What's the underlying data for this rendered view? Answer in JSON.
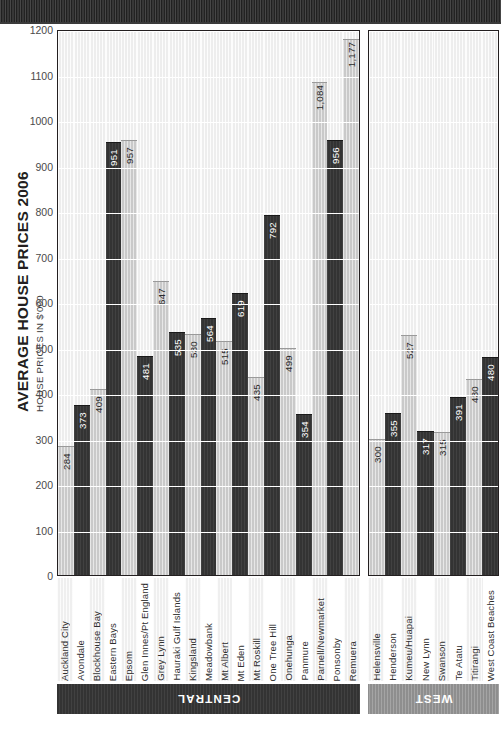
{
  "top_band": {
    "name": "decorative-band"
  },
  "chart_data": {
    "type": "bar",
    "title": "AVERAGE HOUSE PRICES 2006",
    "subtitle": "HOUSE PRICES IN $'000",
    "xlabel": "",
    "ylabel": "HOUSE PRICES IN $'000",
    "ylim": [
      0,
      1200
    ],
    "ytick_step": 100,
    "yticks": [
      1200,
      1100,
      1000,
      900,
      800,
      700,
      600,
      500,
      400,
      300,
      200,
      100,
      0
    ],
    "ytick_labels": [
      "1200",
      "1100",
      "1000",
      "900",
      "800",
      "700",
      "600",
      "500",
      "400",
      "300",
      "200",
      "100",
      "0"
    ],
    "grid": true,
    "legend": "none",
    "orientation": "vertical-bars-rotated-page",
    "groups": [
      {
        "name": "CENTRAL",
        "categories": [
          "Auckland City",
          "Avondale",
          "Blockhouse Bay",
          "Eastern Bays",
          "Epsom",
          "Glen Innes/Pt England",
          "Grey Lynn",
          "Hauraki Gulf Islands",
          "Kingsland",
          "Meadowbank",
          "Mt Albert",
          "Mt Eden",
          "Mt Roskill",
          "One Tree Hill",
          "Onehunga",
          "Panmure",
          "Parnell/Newmarket",
          "Ponsonby",
          "Remuera"
        ],
        "values": [
          284,
          373,
          409,
          951,
          957,
          481,
          647,
          535,
          530,
          564,
          515,
          619,
          435,
          792,
          499,
          354,
          1084,
          956,
          1177
        ],
        "value_labels": [
          "284",
          "373",
          "409",
          "951",
          "957",
          "481",
          "647",
          "535",
          "530",
          "564",
          "515",
          "619",
          "435",
          "792",
          "499",
          "354",
          "1,084",
          "956",
          "1,177"
        ]
      },
      {
        "name": "WEST",
        "categories": [
          "Helensville",
          "Henderson",
          "Kumeu/Huapai",
          "New Lynn",
          "Swanson",
          "Te Atatu",
          "Titirangi",
          "West Coast Beaches"
        ],
        "values": [
          300,
          355,
          527,
          317,
          315,
          391,
          430,
          480
        ],
        "value_labels": [
          "300",
          "355",
          "527",
          "317",
          "315",
          "391",
          "430",
          "480"
        ]
      }
    ]
  },
  "colors": {
    "bar_light": "#c9c9c9",
    "bar_dark": "#333333",
    "bar_mid": "#8e8e8e",
    "bar_pale": "#e2e2e2",
    "banner_central": "#333333",
    "banner_west": "#8e8e8e",
    "axis": "#231f20",
    "text": "#231f20"
  }
}
